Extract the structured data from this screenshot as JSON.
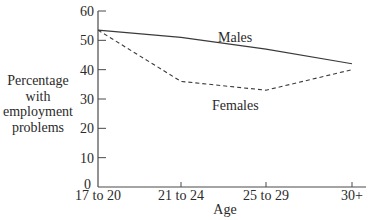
{
  "chart_data": {
    "type": "line",
    "title": "",
    "xlabel": "Age",
    "ylabel": "Percentage with employment problems",
    "ylabel_lines": [
      "Percentage",
      "with",
      "employment",
      "problems"
    ],
    "categories": [
      "17 to 20",
      "21 to 24",
      "25 to 29",
      "30+"
    ],
    "yticks": [
      0,
      10,
      20,
      30,
      40,
      50,
      60
    ],
    "ylim": [
      0,
      60
    ],
    "grid": false,
    "legend": "inline labels",
    "series": [
      {
        "name": "Males",
        "style": "solid",
        "values": [
          53.5,
          51,
          47,
          42
        ]
      },
      {
        "name": "Females",
        "style": "dashed",
        "values": [
          53.5,
          36,
          33,
          40
        ]
      }
    ],
    "annotations": [
      {
        "text": "Males",
        "near_series": "Males"
      },
      {
        "text": "Females",
        "near_series": "Females"
      }
    ]
  },
  "colors": {
    "line": "#3a3a3a",
    "text": "#2a2a2a",
    "axis": "#4a4a4a"
  }
}
